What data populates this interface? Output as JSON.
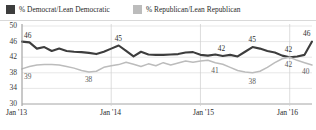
{
  "legend": {
    "position": "top-left",
    "items": [
      {
        "label": "% Democrat/Lean Democratic",
        "color": "#3d3d3d",
        "key": "democrat"
      },
      {
        "label": "% Republican/Lean Republican",
        "color": "#bcbcbc",
        "key": "republican"
      }
    ]
  },
  "axes": {
    "y_ticks": [
      "50",
      "46",
      "42",
      "38",
      "34",
      "30"
    ],
    "x_ticks": [
      "Jan '13",
      "Jan '14",
      "Jan '15",
      "Jan '16"
    ]
  },
  "callouts": {
    "dem_start": "46",
    "dem_peak_2013": "45",
    "dem_mid_2015": "42",
    "dem_peak_2015": "45",
    "dem_converge": "42",
    "dem_end": "46",
    "rep_start": "39",
    "rep_low_2013": "38",
    "rep_mid_2015": "41",
    "rep_low_2015": "38",
    "rep_converge": "42",
    "rep_end": "40"
  },
  "chart_data": {
    "type": "line",
    "title": "",
    "subtitle": "",
    "xlabel": "",
    "ylabel": "",
    "ylim": [
      30,
      50
    ],
    "y_ticks": [
      30,
      34,
      38,
      42,
      46,
      50
    ],
    "grid": true,
    "legend_position": "top-left",
    "x_tick_labels": [
      "Jan '13",
      "Jan '14",
      "Jan '15",
      "Jan '16"
    ],
    "x_tick_indices": [
      0,
      12,
      24,
      36
    ],
    "x": [
      "Jan '13",
      "Feb '13",
      "Mar '13",
      "Apr '13",
      "May '13",
      "Jun '13",
      "Jul '13",
      "Aug '13",
      "Sep '13",
      "Oct '13",
      "Nov '13",
      "Dec '13",
      "Jan '14",
      "Feb '14",
      "Mar '14",
      "Apr '14",
      "May '14",
      "Jun '14",
      "Jul '14",
      "Aug '14",
      "Sep '14",
      "Oct '14",
      "Nov '14",
      "Dec '14",
      "Jan '15",
      "Feb '15",
      "Mar '15",
      "Apr '15",
      "May '15",
      "Jun '15",
      "Jul '15",
      "Aug '15",
      "Sep '15",
      "Oct '15",
      "Nov '15",
      "Dec '15",
      "Jan '16",
      "Feb '16",
      "Mar '16",
      "Apr '16"
    ],
    "series": [
      {
        "name": "% Democrat/Lean Democratic",
        "color": "#3d3d3d",
        "values": [
          46,
          45.8,
          44.2,
          44.6,
          43.6,
          44.2,
          43.6,
          43.4,
          43.3,
          43.1,
          42.8,
          43.4,
          44.2,
          45,
          43.6,
          42.2,
          43.4,
          42.7,
          42.6,
          42.6,
          42.7,
          42.8,
          43.2,
          43.3,
          42.6,
          42.4,
          42.7,
          42.3,
          42.6,
          42.2,
          43.4,
          44.6,
          44.2,
          43.6,
          43.2,
          42.4,
          42,
          42.2,
          42.6,
          46
        ],
        "labeled_points": [
          {
            "x_index": 0,
            "value": 46
          },
          {
            "x_index": 13,
            "value": 45
          },
          {
            "x_index": 27,
            "value": 42
          },
          {
            "x_index": 31,
            "value": 45
          },
          {
            "x_index": 36,
            "value": 42
          },
          {
            "x_index": 39,
            "value": 46
          }
        ]
      },
      {
        "name": "% Republican/Lean Republican",
        "color": "#bcbcbc",
        "values": [
          39,
          39.6,
          40,
          40.1,
          40.1,
          40,
          39.6,
          39.2,
          38.6,
          38.2,
          38.4,
          39.4,
          39.8,
          40.1,
          40.7,
          40.2,
          39.6,
          40.3,
          39.8,
          40.6,
          40,
          40.5,
          41,
          40.7,
          41,
          41.2,
          40.6,
          40.2,
          39.4,
          38.6,
          38.2,
          38,
          38.4,
          39.4,
          40.6,
          41.6,
          42,
          41.2,
          40.6,
          40
        ],
        "labeled_points": [
          {
            "x_index": 0,
            "value": 39
          },
          {
            "x_index": 9,
            "value": 38
          },
          {
            "x_index": 26,
            "value": 41
          },
          {
            "x_index": 31,
            "value": 38
          },
          {
            "x_index": 36,
            "value": 42
          },
          {
            "x_index": 39,
            "value": 40
          }
        ]
      }
    ]
  }
}
